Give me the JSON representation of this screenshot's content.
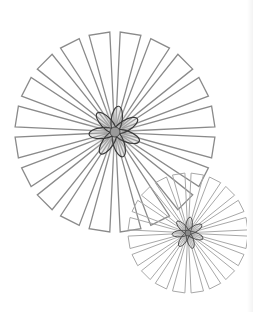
{
  "illustration": {
    "title": "",
    "background": "#ffffff",
    "flowers": [
      {
        "name": "large-flower",
        "cx": 115,
        "cy": 132,
        "outer_radius": 100,
        "inner_radius": 8,
        "petal_count": 20,
        "petal_half_angle_deg": 6,
        "angle_offset_deg": 9,
        "petal_stroke": "#8a8a8a",
        "petal_stroke_width": 1.3,
        "center_glow": "#9a9a9a",
        "star_lobes": 7,
        "star_length": 25,
        "star_width": 5.5,
        "star_stroke": "#3a3a3a",
        "hub_radius": 5,
        "hub_fill": "#9a9a9a"
      },
      {
        "name": "small-flower",
        "cx": 188,
        "cy": 233,
        "outer_radius": 60,
        "inner_radius": 4,
        "petal_count": 20,
        "petal_half_angle_deg": 6,
        "angle_offset_deg": 9,
        "petal_stroke": "#a8a8a8",
        "petal_stroke_width": 1.0,
        "center_glow": "#a0a0a0",
        "star_lobes": 7,
        "star_length": 15,
        "star_width": 3.2,
        "star_stroke": "#4a4a4a",
        "hub_radius": 3,
        "hub_fill": "#8a8a8a"
      }
    ]
  }
}
